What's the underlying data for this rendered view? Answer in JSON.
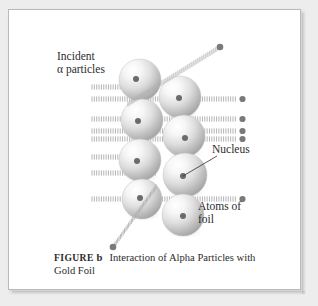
{
  "figure": {
    "background_color": "#ededed",
    "panel_color": "#ffffff",
    "border_color": "#b9b9b9",
    "sphere_fill_light": "#fdfdfd",
    "sphere_fill_dark": "#9b9b9b",
    "nucleus_color": "#6b6b6b",
    "ray_color": "#b0b0b0",
    "particle_color": "#7a7a7a",
    "text_color": "#2c2c2c"
  },
  "labels": {
    "incident_line1": "Incident",
    "incident_line2": "α particles",
    "nucleus": "Nucleus",
    "atoms_line1": "Atoms of",
    "atoms_line2": "foil"
  },
  "caption": {
    "figure_word": "FIGURE",
    "figure_letter": "b",
    "title_line1": "Interaction of Alpha Particles",
    "title_line2": "with Gold Foil"
  },
  "diagram_data": {
    "type": "scientific-illustration",
    "subject": "Rutherford gold foil experiment",
    "atoms": [
      {
        "cx": 132,
        "cy": 71,
        "r": 21,
        "nucleus_dx": -4,
        "nucleus_dy": -1
      },
      {
        "cx": 172,
        "cy": 88,
        "r": 21,
        "nucleus_dx": -1,
        "nucleus_dy": 1
      },
      {
        "cx": 134,
        "cy": 111,
        "r": 21,
        "nucleus_dx": -4,
        "nucleus_dy": 1
      },
      {
        "cx": 176,
        "cy": 127,
        "r": 21,
        "nucleus_dx": 1,
        "nucleus_dy": 2
      },
      {
        "cx": 132,
        "cy": 151,
        "r": 21,
        "nucleus_dx": -3,
        "nucleus_dy": 1
      },
      {
        "cx": 177,
        "cy": 166,
        "r": 22,
        "nucleus_dx": -2,
        "nucleus_dy": 1
      },
      {
        "cx": 134,
        "cy": 190,
        "r": 20,
        "nucleus_dx": -2,
        "nucleus_dy": -1
      },
      {
        "cx": 175,
        "cy": 206,
        "r": 21,
        "nucleus_dx": 0,
        "nucleus_dy": 1
      }
    ],
    "straight_beams": [
      {
        "y": 78,
        "x_start": 84,
        "x_end": 128
      },
      {
        "y": 90,
        "x_start": 84,
        "x_end": 232,
        "exit_dot": true
      },
      {
        "y": 110,
        "x_start": 84,
        "x_end": 232,
        "exit_dot": true
      },
      {
        "y": 122,
        "x_start": 84,
        "x_end": 232,
        "exit_dot": true
      },
      {
        "y": 130,
        "x_start": 84,
        "x_end": 232,
        "exit_dot": true
      },
      {
        "y": 148,
        "x_start": 84,
        "x_end": 150
      },
      {
        "y": 164,
        "x_start": 84,
        "x_end": 150
      },
      {
        "y": 190,
        "x_start": 84,
        "x_end": 232,
        "exit_dot": true
      }
    ],
    "deflected_rays": [
      {
        "name": "backscatter-up-right",
        "x1": 120,
        "y1": 95,
        "x2": 212,
        "y2": 38,
        "end_dot": true
      },
      {
        "name": "deflected-down-left",
        "x1": 148,
        "y1": 178,
        "x2": 105,
        "y2": 238,
        "end_dot": true
      }
    ],
    "incoming_particles": [
      {
        "x": 117,
        "y": 116
      }
    ],
    "leader_lines": [
      {
        "name": "nucleus-leader",
        "x1": 209,
        "y1": 147,
        "x2": 175,
        "y2": 167
      }
    ]
  }
}
